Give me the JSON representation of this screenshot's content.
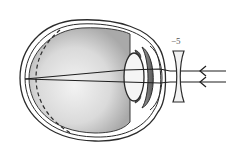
{
  "diagram": {
    "lens": {
      "label": "−5",
      "type": "concave"
    },
    "parts": [
      "sclera",
      "eyeball-interior",
      "retina-position-dashed",
      "crystalline-lens",
      "iris",
      "cornea",
      "corrective-lens",
      "incoming-parallel-rays"
    ],
    "colors": {
      "outline": "#2b2b2b",
      "eyeball_fill": "#cfcfcf",
      "eyeball_highlight": "#f0f0f0",
      "lens_fill": "#f2f2f2"
    }
  }
}
